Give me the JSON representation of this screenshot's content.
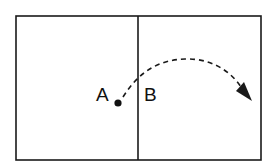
{
  "diagram": {
    "labels": {
      "a": "A",
      "b": "B"
    },
    "colors": {
      "stroke": "#1a1a1a",
      "background": "#ffffff"
    },
    "regions": [
      "left-region",
      "right-region"
    ],
    "point": "A",
    "arrow_style": "dashed-curved"
  }
}
